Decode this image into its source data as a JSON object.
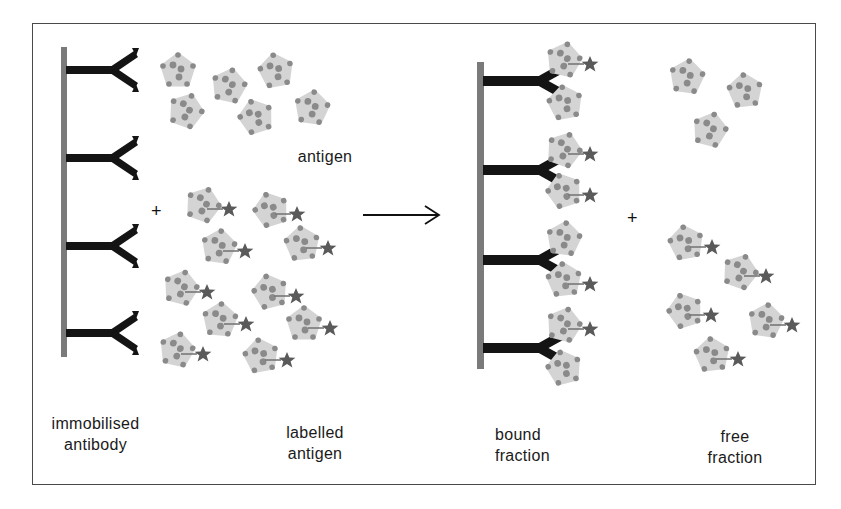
{
  "diagram": {
    "colors": {
      "frame": "#4a4a4a",
      "support_bar": "#7a7a7a",
      "antibody": "#141414",
      "antigen_body": "#d4d4d4",
      "antigen_dots": "#8a8a8a",
      "label_star": "#5a5a5a",
      "text": "#1a1a1a"
    },
    "operators": {
      "plus_left": "+",
      "plus_right": "+",
      "arrow": "reaction-arrow"
    },
    "labels": {
      "antigen": "antigen",
      "immobilised_line1": "immobilised",
      "immobilised_line2": "antibody",
      "labelled_line1": "labelled",
      "labelled_line2": "antigen",
      "bound_line1": "bound",
      "bound_line2": "fraction",
      "free_line1": "free",
      "free_line2": "fraction"
    },
    "left_antibodies": [
      {
        "y": 70
      },
      {
        "y": 158
      },
      {
        "y": 246
      },
      {
        "y": 333
      }
    ],
    "right_antibodies": [
      {
        "y": 81
      },
      {
        "y": 170
      },
      {
        "y": 260
      },
      {
        "y": 348
      }
    ],
    "left_antigens": [
      {
        "x": 178,
        "y": 71
      },
      {
        "x": 229,
        "y": 86
      },
      {
        "x": 276,
        "y": 71
      },
      {
        "x": 186,
        "y": 111
      },
      {
        "x": 256,
        "y": 117
      },
      {
        "x": 312,
        "y": 108
      }
    ],
    "left_labelled_antigens": [
      {
        "x": 203,
        "y": 205
      },
      {
        "x": 271,
        "y": 210
      },
      {
        "x": 219,
        "y": 247
      },
      {
        "x": 302,
        "y": 244
      },
      {
        "x": 181,
        "y": 288
      },
      {
        "x": 270,
        "y": 292
      },
      {
        "x": 220,
        "y": 320
      },
      {
        "x": 304,
        "y": 324
      },
      {
        "x": 177,
        "y": 350
      },
      {
        "x": 261,
        "y": 356
      }
    ],
    "bound_antigens": [
      {
        "x": 564,
        "y": 60,
        "star": true
      },
      {
        "x": 565,
        "y": 103,
        "star": false
      },
      {
        "x": 564,
        "y": 150,
        "star": true
      },
      {
        "x": 564,
        "y": 191,
        "star": true
      },
      {
        "x": 564,
        "y": 239,
        "star": false
      },
      {
        "x": 564,
        "y": 280,
        "star": true
      },
      {
        "x": 564,
        "y": 325,
        "star": true
      },
      {
        "x": 564,
        "y": 368,
        "star": false
      }
    ],
    "free_antigens": [
      {
        "x": 687,
        "y": 77
      },
      {
        "x": 745,
        "y": 91
      },
      {
        "x": 710,
        "y": 130
      }
    ],
    "free_labelled_antigens": [
      {
        "x": 686,
        "y": 243
      },
      {
        "x": 740,
        "y": 272
      },
      {
        "x": 685,
        "y": 311
      },
      {
        "x": 766,
        "y": 321
      },
      {
        "x": 712,
        "y": 355
      }
    ]
  }
}
